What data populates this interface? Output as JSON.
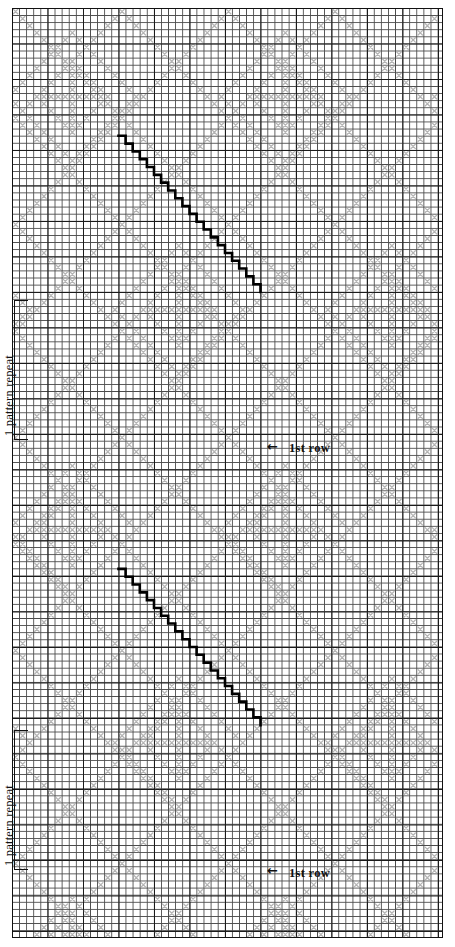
{
  "document": {
    "kind": "knitting-chart",
    "title": "Argyle lace knitting chart",
    "background_color": "#ffffff",
    "ink_color": "#111111",
    "symbol_color": "#b0b0b0",
    "grid": {
      "cell_px": 7.1,
      "major_every": 5,
      "columns": 60,
      "rows": 131,
      "left_px": 12,
      "top_px": 8,
      "width_px": 431,
      "height_px": 930,
      "minor_line_color": "#4a4a4a",
      "major_line_color": "#1a1a1a",
      "grid_on": true
    },
    "annotations": {
      "pattern_repeats": [
        {
          "label": "1 pattern repeat",
          "top_px": 300,
          "height_px": 140
        },
        {
          "label": "1 pattern repeat",
          "top_px": 730,
          "height_px": 140
        }
      ],
      "row_markers": [
        {
          "label": "1st row",
          "arrow": "left-arrow-icon",
          "arrow_glyph": "←",
          "x_px": 290,
          "y_px": 443
        },
        {
          "label": "1st row",
          "arrow": "left-arrow-icon",
          "arrow_glyph": "←",
          "x_px": 290,
          "y_px": 868
        }
      ]
    },
    "bold_lines": [
      {
        "name": "decrease-line-upper",
        "start_col": 15,
        "start_row": 18,
        "end_col": 35,
        "end_row": 40,
        "direction": "down-right"
      },
      {
        "name": "decrease-line-lower",
        "start_col": 15,
        "start_row": 79,
        "end_col": 35,
        "end_row": 101,
        "direction": "down-right"
      }
    ],
    "chart_data": {
      "type": "heatmap",
      "title": "Argyle lace knitting chart",
      "xlabel": "",
      "ylabel": "",
      "legend": [
        "1 pattern repeat",
        "1st row"
      ],
      "notes": "Gray x-marks form an argyle diamond lattice; bold black staircases mark paired decrease lines. Vertical motif repeats twice."
    }
  }
}
